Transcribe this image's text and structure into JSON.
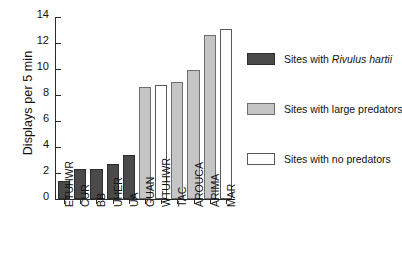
{
  "chart_data": {
    "type": "bar",
    "title": "",
    "xlabel": "",
    "ylabel": "Displays per 5 min",
    "ylim": [
      0,
      14
    ],
    "yticks": [
      0,
      2,
      4,
      6,
      8,
      10,
      12,
      14
    ],
    "ytick_labels": [
      "0",
      "2",
      "4",
      "6",
      "8",
      "10",
      "12",
      "14"
    ],
    "grid": false,
    "legend_position": "right",
    "categories": [
      "ETUHWR",
      "CUR",
      "BB",
      "UHER",
      "UA",
      "GUAN",
      "WTUHWR",
      "TAC",
      "AROUCA",
      "ARIMA",
      "MAR"
    ],
    "values": [
      1.4,
      2.3,
      2.3,
      2.7,
      3.4,
      8.6,
      8.8,
      9.0,
      9.9,
      12.6,
      13.1
    ],
    "bar_groups": [
      "rivulus",
      "rivulus",
      "rivulus",
      "rivulus",
      "rivulus",
      "large-predators",
      "no-predators",
      "large-predators",
      "large-predators",
      "large-predators",
      "no-predators"
    ],
    "legend": [
      {
        "key": "rivulus",
        "label_prefix": "Sites with ",
        "label_italic": "Rivulus hartii",
        "label_suffix": "",
        "color": "#4a4a4a"
      },
      {
        "key": "large-predators",
        "label_prefix": "Sites with large predators",
        "label_italic": "",
        "label_suffix": "",
        "color": "#c5c5c5"
      },
      {
        "key": "no-predators",
        "label_prefix": "Sites with no predators",
        "label_italic": "",
        "label_suffix": "",
        "color": "#ffffff"
      }
    ]
  }
}
